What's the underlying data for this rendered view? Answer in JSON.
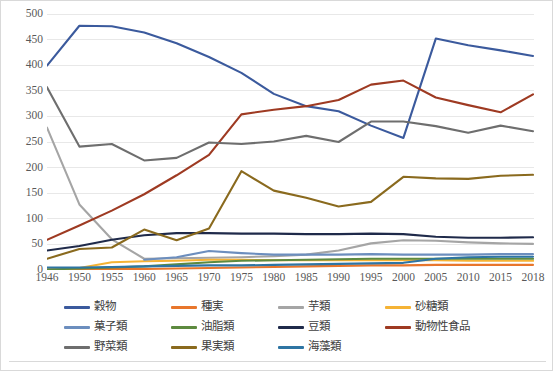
{
  "chart_data": {
    "type": "line",
    "title": "",
    "subtitle": "",
    "xlabel": "",
    "ylabel": "",
    "xlim_categories": true,
    "ylim": [
      0,
      500
    ],
    "ytick_step": 50,
    "grid": "horizontal",
    "legend_position": "bottom",
    "categories": [
      "1946",
      "1950",
      "1955",
      "1960",
      "1965",
      "1970",
      "1975",
      "1980",
      "1985",
      "1990",
      "1995",
      "2000",
      "2005",
      "2010",
      "2015",
      "2018"
    ],
    "ytick_labels": [
      "0",
      "50",
      "100",
      "150",
      "200",
      "250",
      "300",
      "350",
      "400",
      "450",
      "500"
    ],
    "series": [
      {
        "name": "穀物",
        "color": "#3b5a9d",
        "values": [
          399,
          477,
          476,
          464,
          443,
          416,
          385,
          344,
          320,
          310,
          282,
          258,
          452,
          439,
          429,
          418
        ]
      },
      {
        "name": "種実",
        "color": "#e8762c",
        "values": [
          1,
          2,
          2,
          2,
          3,
          4,
          5,
          6,
          7,
          8,
          9,
          9,
          10,
          10,
          10,
          10
        ]
      },
      {
        "name": "芋類",
        "color": "#a5a5a5",
        "values": [
          278,
          128,
          60,
          22,
          23,
          24,
          25,
          27,
          30,
          38,
          52,
          58,
          57,
          54,
          52,
          51
        ]
      },
      {
        "name": "砂糖類",
        "color": "#f5b335",
        "values": [
          1,
          4,
          15,
          17,
          18,
          20,
          20,
          19,
          19,
          19,
          19,
          19,
          19,
          18,
          18,
          18
        ]
      },
      {
        "name": "菓子類",
        "color": "#6c8ebe",
        "values": [
          null,
          null,
          null,
          20,
          25,
          37,
          33,
          30,
          30,
          30,
          31,
          30,
          30,
          30,
          31,
          31
        ]
      },
      {
        "name": "油脂類",
        "color": "#5d8a3f",
        "values": [
          1,
          3,
          5,
          7,
          11,
          15,
          18,
          19,
          20,
          21,
          22,
          22,
          22,
          22,
          22,
          22
        ]
      },
      {
        "name": "豆類",
        "color": "#1f2a4a",
        "values": [
          38,
          47,
          59,
          68,
          72,
          72,
          71,
          71,
          70,
          70,
          71,
          70,
          65,
          63,
          63,
          64
        ]
      },
      {
        "name": "動物性食品",
        "color": "#9e3a22",
        "values": [
          59,
          87,
          116,
          148,
          185,
          225,
          304,
          313,
          320,
          332,
          362,
          370,
          337,
          322,
          308,
          343
        ]
      },
      {
        "name": "野菜類",
        "color": "#6e6e6e",
        "values": [
          357,
          241,
          246,
          214,
          219,
          249,
          246,
          251,
          262,
          250,
          290,
          290,
          281,
          268,
          282,
          271
        ]
      },
      {
        "name": "果実類",
        "color": "#8a6a1e",
        "values": [
          22,
          41,
          44,
          79,
          58,
          81,
          193,
          155,
          141,
          124,
          133,
          182,
          179,
          178,
          184,
          186
        ]
      },
      {
        "name": "海藻類",
        "color": "#2e75a3",
        "values": [
          5,
          5,
          6,
          7,
          8,
          9,
          9,
          10,
          11,
          12,
          13,
          14,
          22,
          25,
          26,
          26
        ]
      }
    ]
  },
  "legend": {
    "rows": [
      [
        "穀物",
        "種実",
        "芋類",
        "砂糖類"
      ],
      [
        "菓子類",
        "油脂類",
        "豆類",
        "動物性食品"
      ],
      [
        "野菜類",
        "果実類",
        "海藻類"
      ]
    ]
  },
  "colors": {
    "background": "#ffffff",
    "border": "#d9d9d9",
    "gridline": "#e8e8e8",
    "tick_text": "#595959",
    "legend_text": "#404040"
  }
}
